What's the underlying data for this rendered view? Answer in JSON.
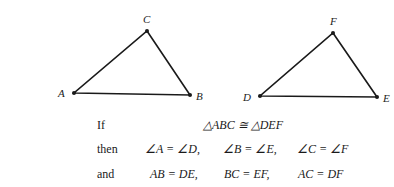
{
  "figure": {
    "triangle1": {
      "vertices": {
        "A": {
          "label": "A",
          "x": 74,
          "y": 93
        },
        "B": {
          "label": "B",
          "x": 190,
          "y": 95
        },
        "C": {
          "label": "C",
          "x": 147,
          "y": 31
        }
      }
    },
    "triangle2": {
      "vertices": {
        "D": {
          "label": "D",
          "x": 260,
          "y": 96
        },
        "E": {
          "label": "E",
          "x": 377,
          "y": 97
        },
        "F": {
          "label": "F",
          "x": 333,
          "y": 33
        }
      }
    },
    "stroke_color": "#1a1a1a"
  },
  "statements": {
    "if_row": {
      "keyword": "If",
      "expr": "△ABC ≅ △DEF"
    },
    "then_row": {
      "keyword": "then",
      "exprs": [
        "∠A = ∠D,",
        "∠B = ∠E,",
        "∠C = ∠F"
      ]
    },
    "and_row": {
      "keyword": "and",
      "exprs": [
        "AB = DE,",
        "BC = EF,",
        "AC = DF"
      ]
    }
  }
}
